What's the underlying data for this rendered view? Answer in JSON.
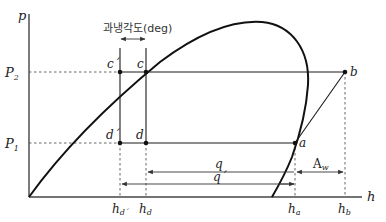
{
  "diagram": {
    "type": "pressure-enthalpy (p-h) diagram, refrigeration cycle with subcooling",
    "axes": {
      "y_label": "p",
      "x_label": "h"
    },
    "pressure_levels": {
      "p2": {
        "label": "P",
        "sub": "2"
      },
      "p1": {
        "label": "P",
        "sub": "1"
      }
    },
    "points": {
      "c_prime": "c´",
      "c": "c",
      "b": "b",
      "d_prime": "d´",
      "d": "d",
      "a": "a"
    },
    "enthalpy_ticks": [
      {
        "id": "hd_prime",
        "base": "h",
        "sub": "d´"
      },
      {
        "id": "hd",
        "base": "h",
        "sub": "d"
      },
      {
        "id": "ha",
        "base": "h",
        "sub": "a"
      },
      {
        "id": "hb",
        "base": "h",
        "sub": "b"
      }
    ],
    "annotations": {
      "subcooling": "과냉각도(deg)",
      "q": "q",
      "q_prime": "q´",
      "aw": {
        "base": "A",
        "sub": "w"
      }
    },
    "colors": {
      "line": "#1a1a1a",
      "dashed": "#555555",
      "axis": "#444444"
    }
  }
}
